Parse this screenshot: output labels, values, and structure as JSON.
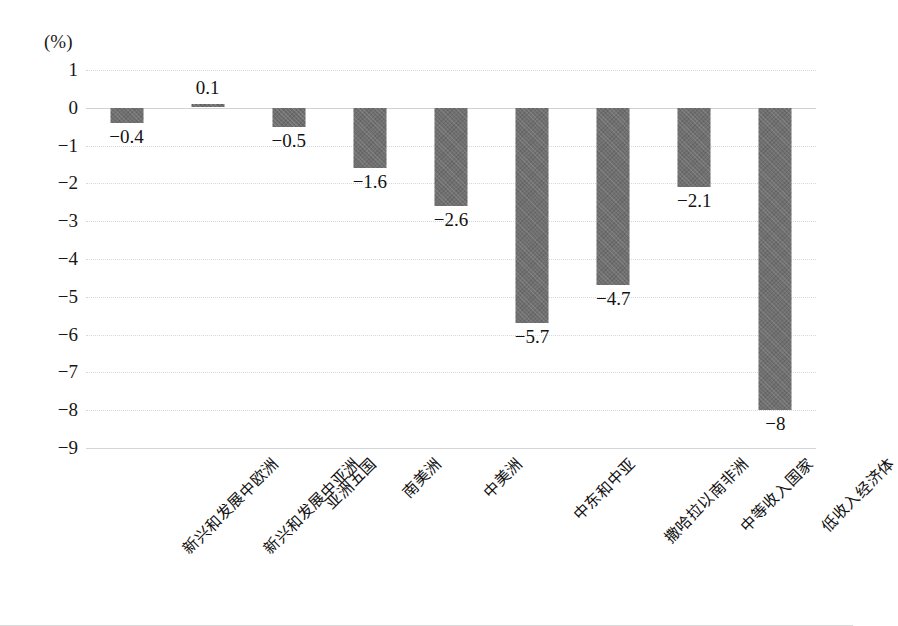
{
  "chart_data": {
    "type": "bar",
    "title": "",
    "subtitle": "",
    "xlabel": "",
    "ylabel": "(%)",
    "unit_label": "(%)",
    "ylim": [
      -9,
      1
    ],
    "ytick_step": 1,
    "grid": true,
    "grid_axis": "y",
    "legend": false,
    "legend_position": "none",
    "bar_color": "#6e6e6e",
    "orientation": "vertical",
    "categories": [
      "新兴和发展中欧洲",
      "新兴和发展中亚洲",
      "亚洲五国",
      "南美洲",
      "中美洲",
      "中东和中亚",
      "撒哈拉以南非洲",
      "中等收入国家",
      "低收入经济体"
    ],
    "values": [
      -0.4,
      0.1,
      -0.5,
      -1.6,
      -2.6,
      -5.7,
      -4.7,
      -2.1,
      -8
    ],
    "data_labels": [
      "−0.4",
      "0.1",
      "−0.5",
      "−1.6",
      "−2.6",
      "−5.7",
      "−4.7",
      "−2.1",
      "−8"
    ],
    "ytick_labels": [
      "1",
      "0",
      "−1",
      "−2",
      "−3",
      "−4",
      "−5",
      "−6",
      "−7",
      "−8",
      "−9"
    ],
    "ytick_values": [
      1,
      0,
      -1,
      -2,
      -3,
      -4,
      -5,
      -6,
      -7,
      -8,
      -9
    ]
  }
}
